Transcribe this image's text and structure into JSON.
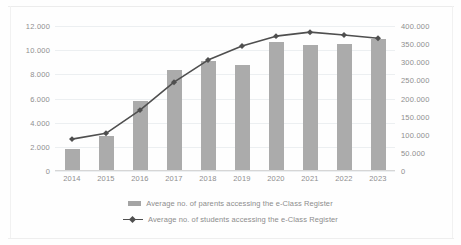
{
  "chart_data": {
    "type": "bar",
    "title": "",
    "subtitle": "",
    "xlabel": "",
    "ylabel": "",
    "categories": [
      "2014",
      "2015",
      "2016",
      "2017",
      "2018",
      "2019",
      "2020",
      "2021",
      "2022",
      "2023"
    ],
    "grid": true,
    "legend_position": "bottom",
    "axes": {
      "left": {
        "label": "",
        "ylim": [
          0,
          12000
        ],
        "tick_values": [
          0,
          2000,
          4000,
          6000,
          8000,
          10000,
          12000
        ],
        "tick_labels": [
          "0",
          "2.000",
          "4.000",
          "6.000",
          "8.000",
          "10.000",
          "12.000"
        ]
      },
      "right": {
        "label": "",
        "ylim": [
          0,
          400000
        ],
        "tick_values": [
          0,
          50000,
          100000,
          150000,
          200000,
          250000,
          300000,
          350000,
          400000
        ],
        "tick_labels": [
          "0",
          "50.000",
          "100.000",
          "150.000",
          "200.000",
          "250.000",
          "300.000",
          "350.000",
          "400.000"
        ]
      }
    },
    "series": [
      {
        "name": "Average no. of parents accessing the e-Class Register",
        "type": "bar",
        "axis": "left",
        "color": "#ababab",
        "values": [
          1800,
          2900,
          5800,
          8400,
          9100,
          8800,
          10700,
          10400,
          10500,
          10900
        ]
      },
      {
        "name": "Average no. of students accessing the e-Class Register",
        "type": "line",
        "axis": "right",
        "color": "#4f4f4f",
        "values": [
          88000,
          104000,
          168000,
          245000,
          306000,
          345000,
          372000,
          383000,
          375000,
          366000
        ]
      }
    ]
  },
  "legend": {
    "items": [
      {
        "label": "Average no. of parents accessing the e-Class Register",
        "marker": "bar-swatch"
      },
      {
        "label": "Average no. of students accessing the e-Class Register",
        "marker": "line-marker-swatch"
      }
    ]
  }
}
